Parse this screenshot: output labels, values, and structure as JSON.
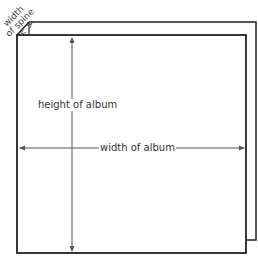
{
  "diagram": {
    "subject": "album",
    "labels": {
      "height": "height of album",
      "width": "width of album",
      "spine_line1": "width",
      "spine_line2": "of spine",
      "spine_arrows": "< >"
    },
    "colors": {
      "line": "#222222",
      "dimension_line": "#555555",
      "text": "#333333",
      "background": "#ffffff"
    }
  }
}
